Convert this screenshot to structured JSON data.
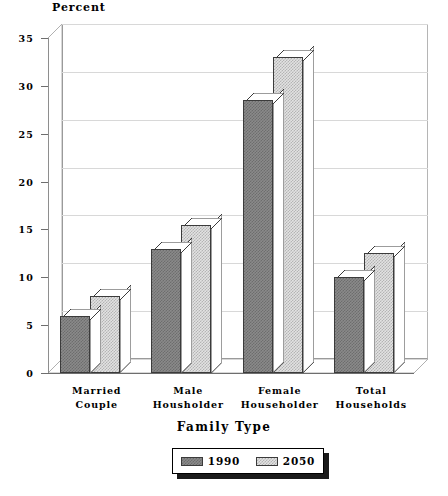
{
  "chart_data": {
    "type": "bar",
    "title": "",
    "xlabel": "Family Type",
    "ylabel": "Percent",
    "categories": [
      "Married\nCouple",
      "Male\nHousholder",
      "Female\nHouseholder",
      "Total\nHouseholds"
    ],
    "category_lines": [
      [
        "Married",
        "Couple"
      ],
      [
        "Male",
        "Housholder"
      ],
      [
        "Female",
        "Householder"
      ],
      [
        "Total",
        "Households"
      ]
    ],
    "series": [
      {
        "name": "1990",
        "values": [
          6,
          13,
          28.5,
          10
        ]
      },
      {
        "name": "2050",
        "values": [
          8,
          15.5,
          33,
          12.5
        ]
      }
    ],
    "ylim": [
      0,
      35
    ],
    "yticks": [
      0,
      5,
      10,
      15,
      20,
      25,
      30,
      35
    ],
    "ytick_labels": [
      "0",
      "5",
      "10",
      "15",
      "20",
      "25",
      "30",
      "35"
    ],
    "grid": true,
    "legend_position": "bottom",
    "style": "3d-bar",
    "colors": {
      "series_1990": "#8a8a8a",
      "series_2050": "#e2e2e2",
      "bar_outline": "#3b3b3b",
      "gridline": "#d8d8d8",
      "axis": "#6e6e6e",
      "text": "#000000",
      "background": "#ffffff"
    }
  },
  "legend": {
    "entries": [
      {
        "label": "1990",
        "series": "1990"
      },
      {
        "label": "2050",
        "series": "2050"
      }
    ]
  }
}
